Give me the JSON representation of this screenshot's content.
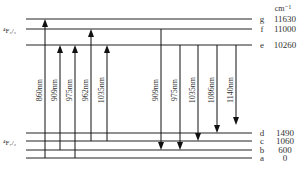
{
  "diagram": {
    "unit_label": "cm⁻¹",
    "upper_manifold": "⁴F₃/₂",
    "lower_manifold": "⁴F₇/₂",
    "levels": [
      {
        "id": "g",
        "value": "11630",
        "y": 19
      },
      {
        "id": "f",
        "value": "11000",
        "y": 29
      },
      {
        "id": "e",
        "value": "10260",
        "y": 45
      },
      {
        "id": "d",
        "value": "1490",
        "y": 133
      },
      {
        "id": "c",
        "value": "1060",
        "y": 141
      },
      {
        "id": "b",
        "value": "600",
        "y": 150
      },
      {
        "id": "a",
        "value": "0",
        "y": 158
      }
    ],
    "absorption": [
      {
        "label": "860nm",
        "x": 45,
        "from": "a",
        "to": "g"
      },
      {
        "label": "909nm",
        "x": 60,
        "from": "b",
        "to": "e"
      },
      {
        "label": "975nm",
        "x": 75,
        "from": "a",
        "to": "e"
      },
      {
        "label": "962nm",
        "x": 91,
        "from": "c",
        "to": "f"
      },
      {
        "label": "1035nm",
        "x": 107,
        "from": "c",
        "to": "e"
      }
    ],
    "emission": [
      {
        "label": "909nm",
        "x": 161,
        "from": "f",
        "to": "b"
      },
      {
        "label": "975nm",
        "x": 180,
        "from": "e",
        "to": "b"
      },
      {
        "label": "1035nm",
        "x": 198,
        "from": "e",
        "to": "c"
      },
      {
        "label": "1086nm",
        "x": 217,
        "from": "e",
        "to": "d"
      },
      {
        "label": "1140nm",
        "x": 236,
        "from": "e",
        "to": "d",
        "end_y": 125
      }
    ]
  }
}
